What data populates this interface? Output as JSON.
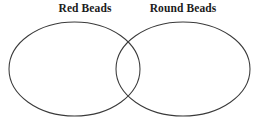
{
  "diagram": {
    "type": "venn",
    "background_color": "#ffffff",
    "stroke_color": "#3a3a3a",
    "title": "",
    "sets": [
      {
        "id": "left",
        "label": "Red Beads",
        "shape": "ellipse",
        "cx": 74.5,
        "cy": 69,
        "rx": 65.5,
        "ry": 47,
        "fill": "none"
      },
      {
        "id": "right",
        "label": "Round Beads",
        "shape": "ellipse",
        "cx": 183,
        "cy": 69,
        "rx": 67,
        "ry": 47,
        "fill": "none"
      }
    ],
    "regions": {
      "left_only": "",
      "intersection": "",
      "right_only": ""
    }
  }
}
